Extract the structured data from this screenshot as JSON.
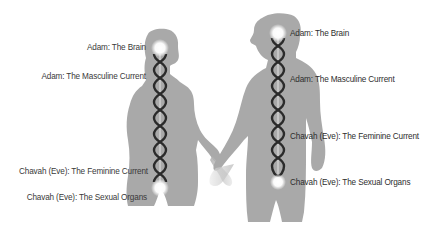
{
  "figures": {
    "left": {
      "role": "woman-silhouette",
      "labels": [
        {
          "text": "Adam: The Brain",
          "y": 43
        },
        {
          "text": "Adam: The Masculine Current",
          "y": 72
        },
        {
          "text": "Chavah (Eve): The Feminine Current",
          "y": 167
        },
        {
          "text": "Chavah (Eve): The Sexual Organs",
          "y": 193
        }
      ]
    },
    "right": {
      "role": "man-silhouette",
      "labels": [
        {
          "text": "Adam: The Brain",
          "y": 29
        },
        {
          "text": "Adam: The Masculine Current",
          "y": 75
        },
        {
          "text": "Chavah (Eve): The Feminine Current",
          "y": 132
        },
        {
          "text": "Chavah (Eve): The Sexual Organs",
          "y": 178
        }
      ]
    }
  },
  "colors": {
    "background": "#ffffff",
    "silhouette": "#a9a9a9",
    "helix": "#2b2b2b",
    "glow": "#ffffff",
    "label": "#3a3a3a"
  }
}
